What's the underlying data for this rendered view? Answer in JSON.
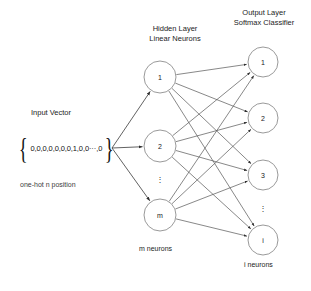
{
  "diagram": {
    "title_hidden_layer": "Hidden Layer\nLinear Neurons",
    "headers": {
      "hidden_line1": "Hidden Layer",
      "hidden_line2": "Linear Neurons",
      "output_line1": "Output Layer",
      "output_line2": "Softmax Classifier"
    },
    "input": {
      "label": "Input Vector",
      "brace_open": "{",
      "brace_close": "}",
      "values": "0,0,0,0,0,0,0,1,0,0···,0",
      "note": "one-hot n position"
    },
    "captions": {
      "hidden_neurons": "m neurons",
      "output_neurons": "i neurons"
    },
    "colors": {
      "node_stroke": "#9a9a9a",
      "edge": "#555555",
      "text": "#1c1c1c",
      "background": "#ffffff"
    },
    "hidden_layer": {
      "cx": 160,
      "r": 16,
      "nodes": [
        {
          "label": "1",
          "cy": 77
        },
        {
          "label": "2",
          "cy": 146
        },
        {
          "label": "m",
          "cy": 215
        }
      ],
      "ellipsis": {
        "x": 160,
        "y": 182,
        "glyph": "⋮"
      }
    },
    "output_layer": {
      "cx": 263,
      "r": 15,
      "nodes": [
        {
          "label": "1",
          "cy": 62
        },
        {
          "label": "2",
          "cy": 118
        },
        {
          "label": "3",
          "cy": 175
        },
        {
          "label": "i",
          "cy": 240
        }
      ],
      "ellipsis": {
        "x": 263,
        "y": 211,
        "glyph": "⋮"
      }
    },
    "input_fanout": {
      "origin_x": 112,
      "origin_y": 148
    }
  }
}
